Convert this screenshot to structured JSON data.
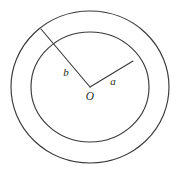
{
  "figure": {
    "background_color": "#ffffff",
    "stroke_color": "#3a3a3a",
    "label_color": "#2b2b2b",
    "center": {
      "x": 90,
      "y": 87
    },
    "outer_circle": {
      "rx": 79,
      "ry": 76,
      "label": "outer-circle"
    },
    "inner_circle": {
      "rx": 59,
      "ry": 55,
      "label": "inner-circle"
    },
    "labels": {
      "center_point": "O",
      "inner_radius": "a",
      "outer_radius": "b"
    },
    "label_positions": {
      "center_point": {
        "x": 90,
        "y": 100
      },
      "inner_radius": {
        "x": 113,
        "y": 85
      },
      "outer_radius": {
        "x": 66,
        "y": 76
      }
    },
    "radius_a": {
      "from": {
        "x": 90,
        "y": 87
      },
      "to": {
        "x": 133,
        "y": 61
      },
      "terminates_on": "inner-circle"
    },
    "radius_b": {
      "from": {
        "x": 90,
        "y": 87
      },
      "to": {
        "x": 41,
        "y": 29
      },
      "terminates_on": "outer-circle"
    }
  }
}
